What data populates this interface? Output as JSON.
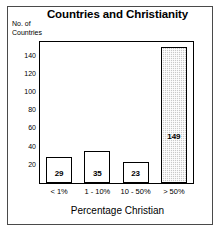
{
  "chart_data": {
    "type": "bar",
    "title": "Countries and Christianity",
    "xlabel": "Percentage Christian",
    "ylabel": "No. of\nCountries",
    "ylabel_line1": "No. of",
    "ylabel_line2": "Countries",
    "categories": [
      "< 1%",
      "1 - 10%",
      "10 - 50%",
      "> 50%"
    ],
    "values": [
      29,
      35,
      23,
      149
    ],
    "value_labels": [
      "29",
      "35",
      "23",
      "149"
    ],
    "ylim": [
      0,
      155
    ],
    "yticks": [
      20,
      40,
      60,
      80,
      100,
      120,
      140
    ],
    "ytick_labels": [
      "20",
      "40",
      "60",
      "80",
      "100",
      "120",
      "140"
    ],
    "grid": false,
    "legend": "none",
    "bar_styles": [
      "outline",
      "outline",
      "outline",
      "pattern-gray"
    ],
    "colors": {
      "bar_outline": "#000000",
      "bar_fill_plain": "#ffffff",
      "bar_fill_pattern": "#c9c9c9",
      "axis": "#000000",
      "text": "#000000",
      "background": "#ffffff",
      "frame": "#4a4a4a"
    }
  }
}
